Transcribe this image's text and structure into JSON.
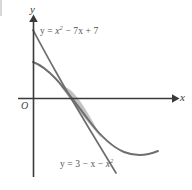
{
  "figure": {
    "kind": "coordinate-plane-diagram",
    "background_color": "#ffffff",
    "axis_color": "#3a3a3a",
    "curve_color": "#6e6e6e",
    "shade_color": "#b9b9b9",
    "labels": {
      "y_axis": "y",
      "x_axis": "x",
      "origin": "O"
    },
    "curves": [
      {
        "name": "parabola-upward",
        "label_prefix": "y = ",
        "label_body": "x",
        "label_exp": "2",
        "label_tail": " − 7x + 7",
        "label_full": "y = x² − 7x + 7",
        "equation": "y = x^2 - 7x + 7",
        "opens": "up",
        "vertex_x": 3.5,
        "vertex_y": -5.25,
        "y_intercept": 7,
        "color": "#6e6e6e"
      },
      {
        "name": "parabola-downward",
        "label_prefix": "y = 3 − x − ",
        "label_body": "x",
        "label_exp": "2",
        "label_tail": "",
        "label_full": "y = 3 − x − x²",
        "equation": "y = 3 - x - x^2",
        "opens": "down",
        "vertex_x": -0.5,
        "vertex_y": 3.25,
        "y_intercept": 3,
        "color": "#6e6e6e"
      }
    ],
    "shaded_region": {
      "name": "region-between-curves",
      "description": "lens-shaped area enclosed between the two parabolas",
      "fill_color": "#bcbcbc",
      "intersections_x": [
        -0.5,
        2.0
      ]
    }
  }
}
